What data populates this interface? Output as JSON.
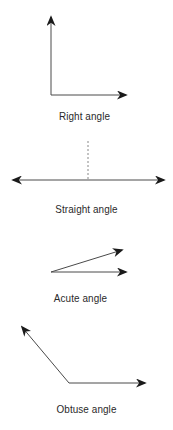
{
  "diagram": {
    "stroke_color": "#4a4a4a",
    "arrowhead_color": "#1a1a1a",
    "label_color": "#2a2a2a",
    "angles": [
      {
        "name": "right",
        "label": "Right angle",
        "degrees": 90
      },
      {
        "name": "straight",
        "label": "Straight angle",
        "degrees": 180
      },
      {
        "name": "acute",
        "label": "Acute angle",
        "degrees": 18
      },
      {
        "name": "obtuse",
        "label": "Obtuse angle",
        "degrees": 130
      }
    ]
  }
}
